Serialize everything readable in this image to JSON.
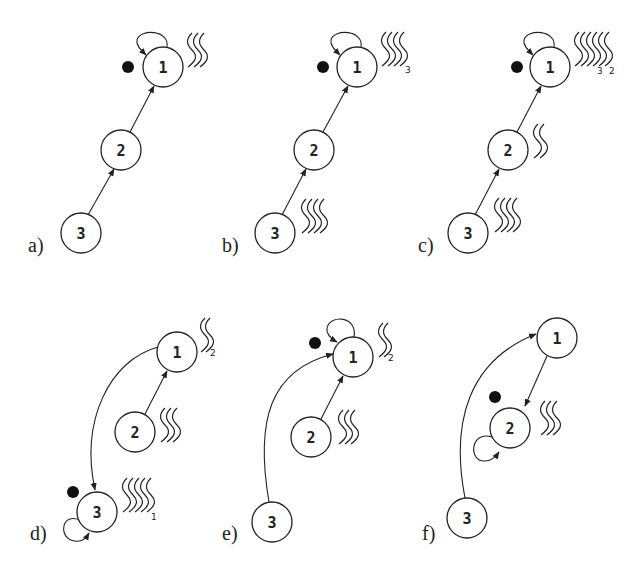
{
  "panels": [
    {
      "label": "a)",
      "nodes": [
        {
          "id": "1"
        },
        {
          "id": "2"
        },
        {
          "id": "3"
        }
      ],
      "edges": [
        "3→2",
        "2→1",
        "1→1 (self-loop)"
      ],
      "token_at": "1",
      "waves": [
        {
          "node": "1",
          "count": 3,
          "subscript": ""
        }
      ]
    },
    {
      "label": "b)",
      "nodes": [
        {
          "id": "1"
        },
        {
          "id": "2"
        },
        {
          "id": "3"
        }
      ],
      "edges": [
        "3→2",
        "2→1",
        "1→1 (self-loop)"
      ],
      "token_at": "1",
      "waves": [
        {
          "node": "1",
          "count": 4,
          "subscript": "3"
        },
        {
          "node": "3",
          "count": 4,
          "subscript": ""
        }
      ]
    },
    {
      "label": "c)",
      "nodes": [
        {
          "id": "1"
        },
        {
          "id": "2"
        },
        {
          "id": "3"
        }
      ],
      "edges": [
        "3→2",
        "2→1",
        "1→1 (self-loop)"
      ],
      "token_at": "1",
      "waves": [
        {
          "node": "1",
          "count": 6,
          "subscript": "3 2"
        },
        {
          "node": "2",
          "count": 2,
          "subscript": ""
        },
        {
          "node": "3",
          "count": 4,
          "subscript": ""
        }
      ]
    },
    {
      "label": "d)",
      "nodes": [
        {
          "id": "1"
        },
        {
          "id": "2"
        },
        {
          "id": "3"
        }
      ],
      "edges": [
        "2→1",
        "1→3",
        "3→3 (self-loop)"
      ],
      "token_at": "3",
      "waves": [
        {
          "node": "1",
          "count": 2,
          "subscript": "2"
        },
        {
          "node": "2",
          "count": 3,
          "subscript": ""
        },
        {
          "node": "3",
          "count": 5,
          "subscript": "1"
        }
      ]
    },
    {
      "label": "e)",
      "nodes": [
        {
          "id": "1"
        },
        {
          "id": "2"
        },
        {
          "id": "3"
        }
      ],
      "edges": [
        "2→1",
        "3→1",
        "1→1 (self-loop)"
      ],
      "token_at": "1",
      "waves": [
        {
          "node": "1",
          "count": 2,
          "subscript": "2"
        },
        {
          "node": "2",
          "count": 3,
          "subscript": ""
        }
      ]
    },
    {
      "label": "f)",
      "nodes": [
        {
          "id": "1"
        },
        {
          "id": "2"
        },
        {
          "id": "3"
        }
      ],
      "edges": [
        "1→2",
        "3→1",
        "2→2 (self-loop)"
      ],
      "token_at": "2",
      "waves": [
        {
          "node": "2",
          "count": 3,
          "subscript": ""
        }
      ]
    }
  ],
  "text": {
    "a": "a)",
    "b": "b)",
    "c": "c)",
    "d": "d)",
    "e": "e)",
    "f": "f)",
    "n1": "1",
    "n2": "2",
    "n3": "3",
    "sub1": "1",
    "sub2": "2",
    "sub3": "3"
  }
}
